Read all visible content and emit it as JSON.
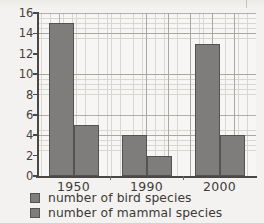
{
  "chart_data": {
    "type": "bar",
    "title": "",
    "xlabel": "",
    "ylabel": "",
    "categories": [
      "1950",
      "1990",
      "2000"
    ],
    "series": [
      {
        "name": "number of bird species",
        "values": [
          15,
          4,
          13
        ],
        "color": "#7e7d7b"
      },
      {
        "name": "number of mammal species",
        "values": [
          5,
          2,
          4
        ],
        "color": "#7e7d7b"
      }
    ],
    "ylim": [
      0,
      16
    ],
    "ytick_labels": [
      "0",
      "2",
      "4",
      "6",
      "8",
      "10",
      "12",
      "14",
      "16"
    ],
    "ytick_values": [
      0,
      2,
      4,
      6,
      8,
      10,
      12,
      14,
      16
    ],
    "grid": "graph-paper minor and major gridlines",
    "legend_position": "bottom-left"
  },
  "legend": {
    "items": [
      {
        "label": "number of bird species"
      },
      {
        "label": "number of mammal species"
      }
    ]
  },
  "colors": {
    "bar_fill": "#7e7d7b",
    "bar_stroke": "#55534f",
    "axis": "#4a4744",
    "grid_minor": "#d3d1cd",
    "grid_major": "#9b9895",
    "plot_background": "#f7f6f4",
    "page_background": "#f3f2f0",
    "text": "#3f3c39"
  }
}
